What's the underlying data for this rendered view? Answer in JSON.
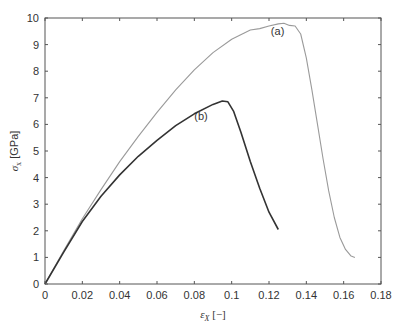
{
  "chart_data": {
    "type": "line",
    "title": "",
    "xlabel": "ε_X [−]",
    "ylabel": "σ_x [GPa]",
    "xlim": [
      0,
      0.18
    ],
    "ylim": [
      0,
      10
    ],
    "x_ticks": [
      "0",
      "0.02",
      "0.04",
      "0.06",
      "0.08",
      "0.1",
      "0.12",
      "0.14",
      "0.16",
      "0.18"
    ],
    "y_ticks": [
      "0",
      "1",
      "2",
      "3",
      "4",
      "5",
      "6",
      "7",
      "8",
      "9",
      "10"
    ],
    "grid": false,
    "legend": null,
    "annotations": [
      {
        "text": "(a)",
        "x": 0.121,
        "y": 9.35
      },
      {
        "text": "(b)",
        "x": 0.08,
        "y": 6.15
      }
    ],
    "series": [
      {
        "name": "(a)",
        "color": "#9a9a9a",
        "x": [
          0,
          0.01,
          0.02,
          0.03,
          0.04,
          0.05,
          0.06,
          0.07,
          0.08,
          0.09,
          0.1,
          0.11,
          0.115,
          0.12,
          0.125,
          0.128,
          0.131,
          0.134,
          0.137,
          0.14,
          0.143,
          0.146,
          0.149,
          0.152,
          0.155,
          0.158,
          0.161,
          0.164,
          0.166
        ],
        "y": [
          0,
          1.25,
          2.45,
          3.55,
          4.6,
          5.55,
          6.45,
          7.3,
          8.05,
          8.7,
          9.2,
          9.55,
          9.6,
          9.7,
          9.78,
          9.8,
          9.72,
          9.7,
          9.4,
          8.5,
          7.3,
          6.0,
          4.7,
          3.5,
          2.5,
          1.75,
          1.3,
          1.05,
          1.0
        ]
      },
      {
        "name": "(b)",
        "color": "#333333",
        "x": [
          0,
          0.01,
          0.02,
          0.03,
          0.04,
          0.05,
          0.06,
          0.07,
          0.08,
          0.09,
          0.095,
          0.098,
          0.101,
          0.105,
          0.11,
          0.115,
          0.12,
          0.125
        ],
        "y": [
          0,
          1.2,
          2.35,
          3.3,
          4.1,
          4.8,
          5.4,
          5.95,
          6.4,
          6.75,
          6.88,
          6.85,
          6.5,
          5.7,
          4.6,
          3.6,
          2.7,
          2.05
        ]
      }
    ]
  }
}
